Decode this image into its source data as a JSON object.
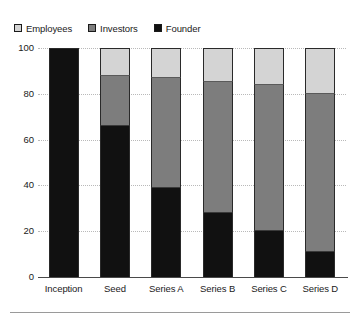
{
  "legend": {
    "position": "top-left",
    "items": [
      {
        "label": "Employees",
        "color": "#d4d4d4",
        "icon": "square-swatch-icon"
      },
      {
        "label": "Investors",
        "color": "#7d7d7d",
        "icon": "square-swatch-icon"
      },
      {
        "label": "Founder",
        "color": "#111111",
        "icon": "square-swatch-icon"
      }
    ]
  },
  "axes": {
    "y_ticks": [
      "100",
      "80",
      "60",
      "40",
      "20",
      "0"
    ],
    "x_ticks": [
      "Inception",
      "Seed",
      "Series A",
      "Series B",
      "Series C",
      "Series D"
    ]
  },
  "chart_data": {
    "type": "bar",
    "title": "",
    "subtitle": "",
    "xlabel": "",
    "ylabel": "",
    "stacked": true,
    "stack_total": 100,
    "grid": true,
    "legend_position": "top-left",
    "ylim": [
      0,
      100
    ],
    "ytick_values": [
      0,
      20,
      40,
      60,
      80,
      100
    ],
    "categories": [
      "Inception",
      "Seed",
      "Series A",
      "Series B",
      "Series C",
      "Series D"
    ],
    "series": [
      {
        "name": "Founder",
        "color": "#111111",
        "values": [
          100,
          66,
          39,
          28,
          20,
          11
        ]
      },
      {
        "name": "Investors",
        "color": "#7d7d7d",
        "values": [
          0,
          22,
          48,
          57,
          64,
          69
        ]
      },
      {
        "name": "Employees",
        "color": "#d4d4d4",
        "values": [
          0,
          12,
          13,
          15,
          16,
          20
        ]
      }
    ],
    "bars": [
      {
        "category": "Inception",
        "founder": 100,
        "investors": 0,
        "employees": 0
      },
      {
        "category": "Seed",
        "founder": 66,
        "investors": 22,
        "employees": 12
      },
      {
        "category": "Series A",
        "founder": 39,
        "investors": 48,
        "employees": 13
      },
      {
        "category": "Series B",
        "founder": 28,
        "investors": 57,
        "employees": 15
      },
      {
        "category": "Series C",
        "founder": 20,
        "investors": 64,
        "employees": 16
      },
      {
        "category": "Series D",
        "founder": 11,
        "investors": 69,
        "employees": 20
      }
    ]
  }
}
